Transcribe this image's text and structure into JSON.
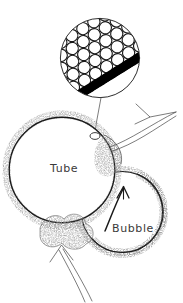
{
  "figure": {
    "background_color": "#ffffff",
    "ink_color": "#1a1a1a",
    "texture_color": "#6e6e6e",
    "band_color": "#000000",
    "labels": {
      "tube": "Tube",
      "bubble": "Bubble"
    },
    "inset": {
      "name": "magnified-cross-section",
      "center_x": 100,
      "center_y": 58,
      "radius": 40,
      "packed_circle_radius": 6.2,
      "band_angle_deg": -32,
      "band_thickness": 9,
      "band_color": "#000000"
    },
    "tube": {
      "center_x": 62,
      "center_y": 170,
      "radius": 53,
      "wall_texture": "stippled"
    },
    "bubble": {
      "center_x": 122,
      "center_y": 212,
      "radius": 42,
      "wall_texture": "stippled"
    },
    "blob": {
      "name": "bottom-deposit-blob",
      "center_x": 62,
      "center_y": 237
    },
    "leader_line": {
      "from_x": 101,
      "from_y": 98,
      "to_x": 95,
      "to_y": 134
    },
    "arrows": [
      {
        "name": "outflow-arrow",
        "style": "outline",
        "direction": "up-right",
        "from_x": 110,
        "from_y": 144,
        "to_x": 176,
        "to_y": 112
      },
      {
        "name": "bubble-pointer-arrow",
        "style": "thin-curved",
        "direction": "up",
        "from_x": 108,
        "from_y": 228,
        "to_x": 124,
        "to_y": 187
      },
      {
        "name": "inflow-arrow",
        "style": "outline",
        "direction": "up",
        "from_x": 88,
        "from_y": 300,
        "to_x": 64,
        "to_y": 248
      }
    ]
  }
}
